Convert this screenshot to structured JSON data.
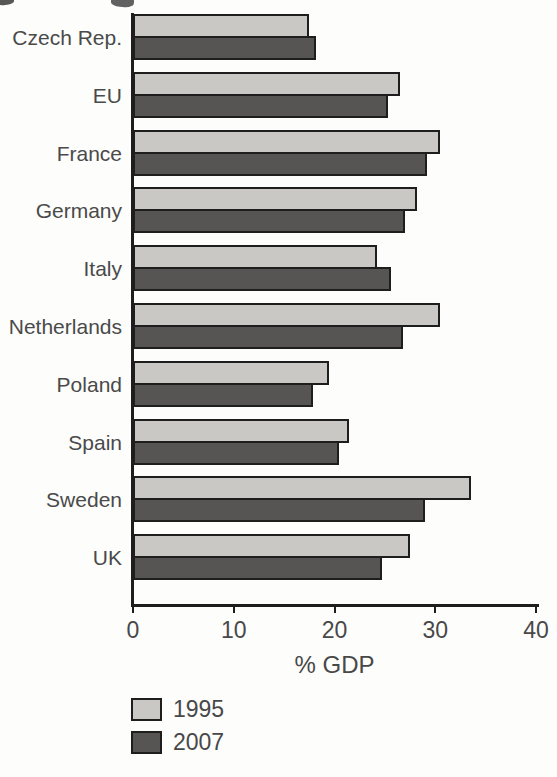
{
  "figure": {
    "background": "#fdfdfc",
    "axis_color": "#1e1e1e",
    "text_color": "#484848"
  },
  "chart_data": {
    "type": "bar",
    "orientation": "horizontal",
    "title": "",
    "xlabel": "% GDP",
    "ylabel": "",
    "categories": [
      "Czech Rep.",
      "EU",
      "France",
      "Germany",
      "Italy",
      "Netherlands",
      "Poland",
      "Spain",
      "Sweden",
      "UK"
    ],
    "series": [
      {
        "name": "1995",
        "color": "#c9c8c5",
        "values": [
          17.5,
          26.5,
          30.5,
          28.2,
          24.2,
          30.5,
          19.5,
          21.4,
          33.5,
          27.5
        ]
      },
      {
        "name": "2007",
        "color": "#575553",
        "values": [
          18.2,
          25.3,
          29.2,
          27.0,
          25.6,
          26.8,
          17.9,
          20.4,
          29.0,
          24.7
        ]
      }
    ],
    "xlim": [
      0,
      40
    ],
    "xticks": [
      0,
      10,
      20,
      30,
      40
    ],
    "grid": false,
    "bar_border_color": "#1e1e1e",
    "legend_position": "bottom-left"
  }
}
